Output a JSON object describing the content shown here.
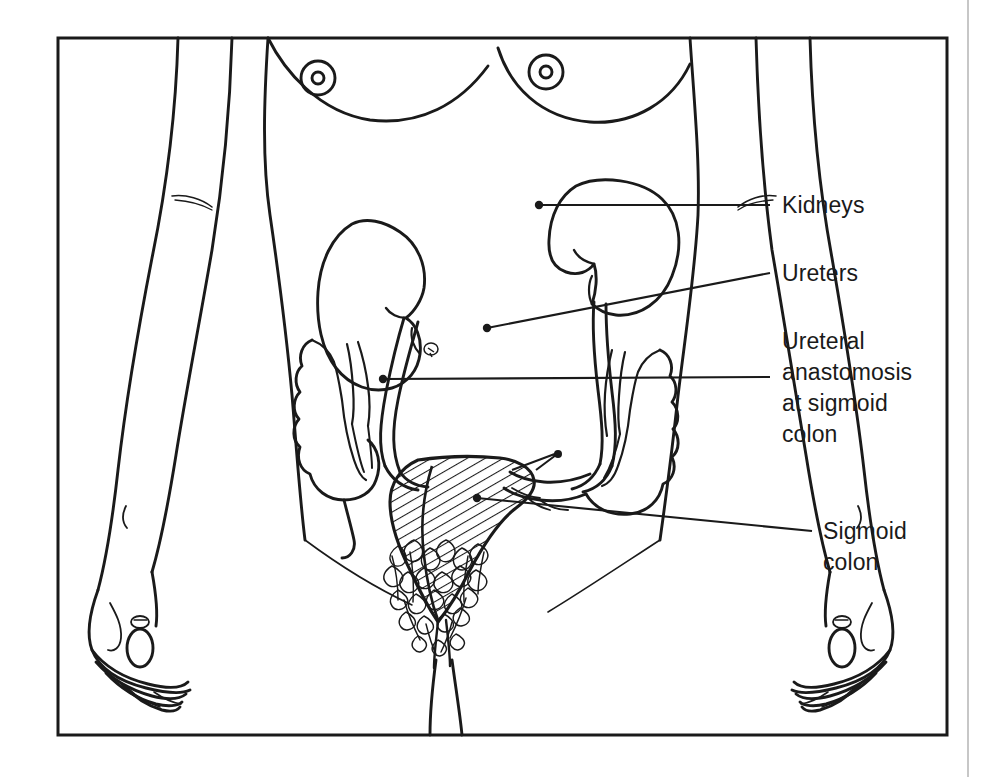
{
  "figure": {
    "frame_color": "#1a1a1a",
    "line_color": "#1a1a1a",
    "background_color": "#ffffff",
    "page_edge_color": "#b9b9b9"
  },
  "labels": [
    {
      "id": "kidneys",
      "text": "Kidneys",
      "lines": [
        "Kidneys"
      ],
      "x": 782,
      "y": 212,
      "leader": {
        "from_x": 770,
        "from_y": 205,
        "to_x": 539,
        "to_y": 205,
        "dot_x": 539,
        "dot_y": 205
      }
    },
    {
      "id": "ureters",
      "text": "Ureters",
      "lines": [
        "Ureters"
      ],
      "x": 782,
      "y": 280,
      "leader": {
        "from_x": 770,
        "from_y": 273,
        "to_x": 487,
        "to_y": 328,
        "dot_x": 487,
        "dot_y": 328
      }
    },
    {
      "id": "ureteral-anastomosis",
      "text": "Ureteral anastomosis at sigmoid colon",
      "lines": [
        "Ureteral",
        "anastomosis",
        "at sigmoid",
        "colon"
      ],
      "x": 782,
      "y": 348,
      "line_height": 31,
      "leader": {
        "from_x": 770,
        "from_y": 377,
        "to_x": 383,
        "to_y": 379,
        "dot_x": 383,
        "dot_y": 379
      }
    },
    {
      "id": "sigmoid-colon",
      "text": "Sigmoid colon",
      "lines": [
        "Sigmoid",
        "colon"
      ],
      "x": 823,
      "y": 538,
      "line_height": 31,
      "leader": {
        "from_x": 812,
        "from_y": 531,
        "to_x": 477,
        "to_y": 498,
        "dot_x": 477,
        "dot_y": 498
      }
    }
  ],
  "anatomy_parts": [
    {
      "name": "torso-outline",
      "label": "Female torso"
    },
    {
      "name": "left-breast",
      "label": "Breast"
    },
    {
      "name": "right-breast",
      "label": "Breast"
    },
    {
      "name": "left-arm",
      "label": "Arm"
    },
    {
      "name": "right-arm",
      "label": "Arm"
    },
    {
      "name": "left-hand",
      "label": "Hand"
    },
    {
      "name": "right-hand",
      "label": "Hand"
    },
    {
      "name": "right-kidney",
      "label": "Kidney"
    },
    {
      "name": "left-kidney",
      "label": "Kidney"
    },
    {
      "name": "right-ureter",
      "label": "Ureter"
    },
    {
      "name": "left-ureter",
      "label": "Ureter"
    },
    {
      "name": "ascending-colon",
      "label": "Ascending colon"
    },
    {
      "name": "descending-colon",
      "label": "Descending colon"
    },
    {
      "name": "sigmoid-colon-shape",
      "label": "Sigmoid colon"
    },
    {
      "name": "pubic-hair",
      "label": "Pubic hair"
    },
    {
      "name": "legs",
      "label": "Legs"
    }
  ]
}
